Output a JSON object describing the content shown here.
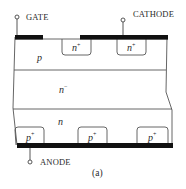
{
  "figure": {
    "caption": "(a)",
    "terminals": {
      "gate": "GATE",
      "cathode": "CATHODE",
      "anode": "ANODE"
    },
    "regions": {
      "p_base": {
        "main": "p",
        "sup": ""
      },
      "n_plus_1": {
        "main": "n",
        "sup": "+"
      },
      "n_plus_2": {
        "main": "n",
        "sup": "+"
      },
      "n_drift": {
        "main": "n",
        "sup": "−"
      },
      "n_buffer": {
        "main": "n",
        "sup": ""
      },
      "p_plus_1": {
        "main": "p",
        "sup": "+"
      },
      "p_plus_2": {
        "main": "p",
        "sup": "+"
      },
      "p_plus_3": {
        "main": "p",
        "sup": "+"
      }
    },
    "colors": {
      "metal": "#111111",
      "outline": "#555555",
      "text": "#2a2a2a"
    }
  }
}
